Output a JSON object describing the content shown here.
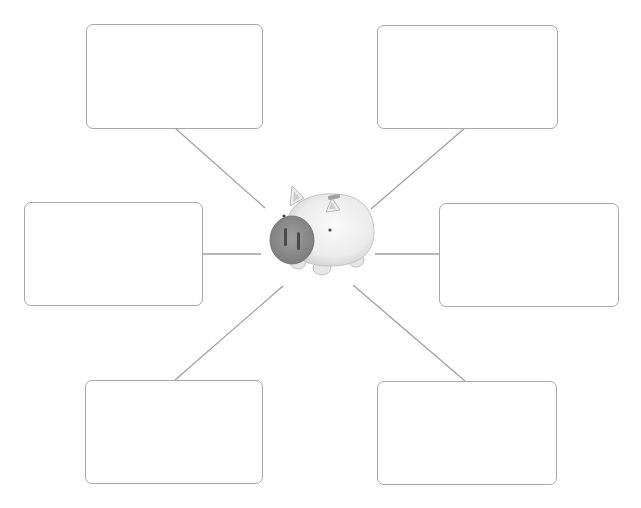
{
  "diagram": {
    "type": "spider-map",
    "center": {
      "label": "",
      "icon": "piggy-bank-icon"
    },
    "colors": {
      "box_border": "#a8a8a8",
      "line": "#a0a0a0",
      "pig_body": "#eeeeee",
      "pig_snout": "#8e8e8e"
    },
    "boxes": [
      {
        "id": "top-left",
        "text": ""
      },
      {
        "id": "top-right",
        "text": ""
      },
      {
        "id": "middle-left",
        "text": ""
      },
      {
        "id": "middle-right",
        "text": ""
      },
      {
        "id": "bottom-left",
        "text": ""
      },
      {
        "id": "bottom-right",
        "text": ""
      }
    ]
  }
}
